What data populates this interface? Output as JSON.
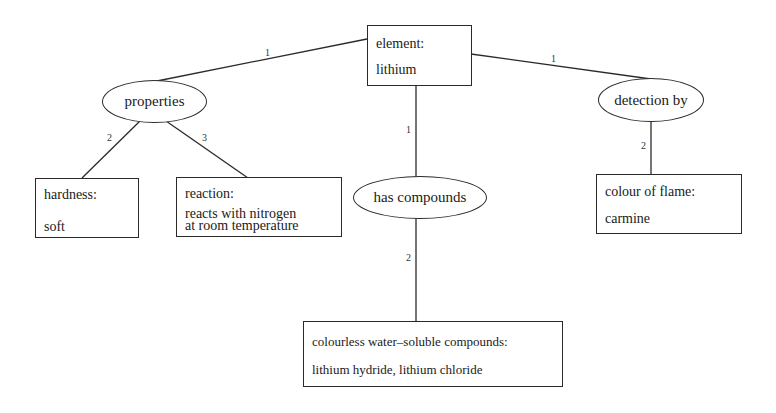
{
  "diagram": {
    "type": "semantic-network",
    "nodes": {
      "element": {
        "shape": "box",
        "title": "element:",
        "value": "lithium"
      },
      "properties": {
        "shape": "ellipse",
        "label": "properties"
      },
      "detection_by": {
        "shape": "ellipse",
        "label": "detection by"
      },
      "has_compounds": {
        "shape": "ellipse",
        "label": "has compounds"
      },
      "hardness": {
        "shape": "box",
        "title": "hardness:",
        "value": "soft"
      },
      "reaction": {
        "shape": "box",
        "title": "reaction:",
        "value_line1": "reacts with nitrogen",
        "value_line2": "at room temperature"
      },
      "colour_of_flame": {
        "shape": "box",
        "title": "colour of flame:",
        "value": "carmine"
      },
      "compounds": {
        "shape": "box",
        "title": "colourless water–soluble compounds:",
        "value": "lithium hydride, lithium chloride"
      }
    },
    "edges": [
      {
        "from": "element",
        "to": "properties",
        "label": "1"
      },
      {
        "from": "element",
        "to": "detection_by",
        "label": "1"
      },
      {
        "from": "element",
        "to": "has_compounds",
        "label": "1"
      },
      {
        "from": "properties",
        "to": "hardness",
        "label": "2"
      },
      {
        "from": "properties",
        "to": "reaction",
        "label": "3"
      },
      {
        "from": "has_compounds",
        "to": "compounds",
        "label": "2"
      },
      {
        "from": "detection_by",
        "to": "colour_of_flame",
        "label": "2"
      }
    ]
  }
}
